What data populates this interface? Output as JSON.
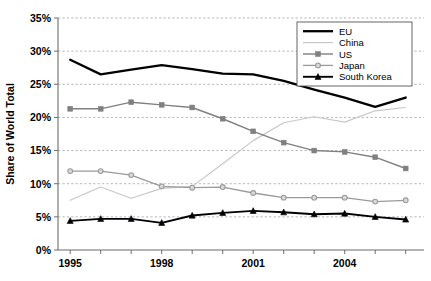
{
  "chart_data": {
    "type": "line",
    "title": "",
    "xlabel": "",
    "ylabel": "Share of World Total",
    "x": [
      1995,
      1996,
      1997,
      1998,
      1999,
      2000,
      2001,
      2002,
      2003,
      2004,
      2005,
      2006
    ],
    "xtick_labels": [
      "1995",
      "1998",
      "2001",
      "2004"
    ],
    "xtick_values": [
      1995,
      1998,
      2001,
      2004
    ],
    "ytick_labels": [
      "0%",
      "5%",
      "10%",
      "15%",
      "20%",
      "25%",
      "30%",
      "35%"
    ],
    "ytick_values": [
      0,
      5,
      10,
      15,
      20,
      25,
      30,
      35
    ],
    "ylim": [
      0,
      35
    ],
    "xlim": [
      1994.6,
      2006.6
    ],
    "grid": true,
    "legend_position": "top-right",
    "series": [
      {
        "name": "EU",
        "color": "#000000",
        "values": [
          28.7,
          26.5,
          27.2,
          27.9,
          27.3,
          26.6,
          26.5,
          25.5,
          24.2,
          23.0,
          21.6,
          23.0
        ]
      },
      {
        "name": "China",
        "color": "#c8c8c8",
        "values": [
          7.5,
          9.5,
          7.8,
          9.3,
          9.6,
          13.0,
          16.5,
          19.2,
          20.1,
          19.3,
          21.0,
          21.5
        ]
      },
      {
        "name": "US",
        "color": "#808080",
        "values": [
          21.3,
          21.3,
          22.3,
          21.9,
          21.5,
          19.8,
          17.9,
          16.2,
          15.0,
          14.8,
          14.0,
          12.3
        ]
      },
      {
        "name": "Japan",
        "color": "#9a9a9a",
        "values": [
          11.9,
          11.9,
          11.3,
          9.6,
          9.4,
          9.5,
          8.6,
          7.9,
          7.9,
          7.9,
          7.3,
          7.5
        ]
      },
      {
        "name": "South Korea",
        "color": "#000000",
        "values": [
          4.4,
          4.7,
          4.7,
          4.1,
          5.2,
          5.6,
          5.9,
          5.7,
          5.4,
          5.5,
          5.0,
          4.6
        ]
      }
    ]
  },
  "legend": {
    "items": [
      {
        "label": "EU",
        "marker": "none"
      },
      {
        "label": "China",
        "marker": "none"
      },
      {
        "label": "US",
        "marker": "square"
      },
      {
        "label": "Japan",
        "marker": "diamond"
      },
      {
        "label": "South Korea",
        "marker": "triangle"
      }
    ]
  },
  "axis": {
    "y_title": "Share of World Total"
  }
}
